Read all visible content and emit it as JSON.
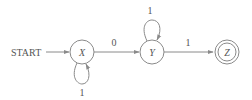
{
  "diagram": {
    "type": "finite-automaton",
    "start_label": "START",
    "colors": {
      "stroke": "#8a8a8a",
      "text": "#555555",
      "background": "#ffffff"
    },
    "states": [
      {
        "id": "X",
        "label": "X",
        "accepting": false,
        "start": true
      },
      {
        "id": "Y",
        "label": "Y",
        "accepting": false,
        "start": false
      },
      {
        "id": "Z",
        "label": "Z",
        "accepting": true,
        "start": false
      }
    ],
    "transitions": [
      {
        "from": "X",
        "to": "X",
        "label": "1"
      },
      {
        "from": "X",
        "to": "Y",
        "label": "0"
      },
      {
        "from": "Y",
        "to": "Y",
        "label": "1"
      },
      {
        "from": "Y",
        "to": "Z",
        "label": "1"
      }
    ]
  }
}
